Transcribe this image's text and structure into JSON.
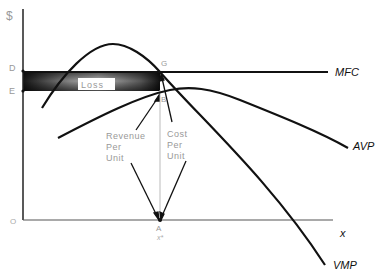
{
  "diagram": {
    "axes": {
      "y_label": "$",
      "x_label": "x",
      "origin_label": "O"
    },
    "price_labels": {
      "D": "D",
      "E": "E"
    },
    "points": {
      "G": "G",
      "B": "B",
      "A": "A",
      "x_star": "x*"
    },
    "loss_label": "Loss",
    "curves": {
      "mfc": "MFC",
      "avp": "AVP",
      "vmp": "VMP"
    },
    "annotations": {
      "revenue": [
        "Revenue",
        "Per",
        "Unit"
      ],
      "cost": [
        "Cost",
        "Per",
        "Unit"
      ]
    },
    "colors": {
      "line": "#111111",
      "label_gray": "#9a9a9a",
      "loss_dark": "#1a1a1a",
      "loss_light": "#9a9a9a"
    }
  }
}
